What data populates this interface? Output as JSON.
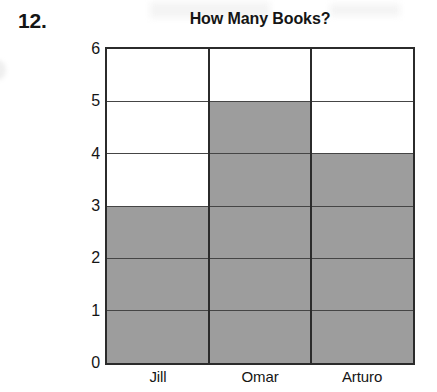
{
  "worksheet": {
    "question_number": "12."
  },
  "chart_data": {
    "type": "bar",
    "title": "How Many Books?",
    "xlabel": "",
    "ylabel": "Number of Books Read",
    "categories": [
      "Jill",
      "Omar",
      "Arturo"
    ],
    "values": [
      3,
      5,
      4
    ],
    "ylim": [
      0,
      6
    ],
    "y_ticks": [
      "0",
      "1",
      "2",
      "3",
      "4",
      "5",
      "6"
    ],
    "grid": true,
    "legend": "none",
    "bar_color": "#9d9d9d",
    "axis_color": "#2b2b2b",
    "gridline_color": "#454545"
  }
}
